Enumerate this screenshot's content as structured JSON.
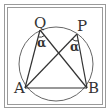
{
  "diagram": {
    "type": "inscribed-angle-geometry",
    "frame": {
      "outer_color": "#9a9a9a",
      "inner_color": "#9a9a9a"
    },
    "circle": {
      "cx": 56,
      "cy": 64,
      "r": 37,
      "stroke": "#666666"
    },
    "points": {
      "Q": {
        "label": "Q",
        "x": 40,
        "y": 30
      },
      "P": {
        "label": "P",
        "x": 77,
        "y": 34
      },
      "A": {
        "label": "A",
        "x": 25,
        "y": 88
      },
      "B": {
        "label": "B",
        "x": 87,
        "y": 88
      }
    },
    "segments": [
      [
        "A",
        "Q"
      ],
      [
        "Q",
        "B"
      ],
      [
        "A",
        "P"
      ],
      [
        "P",
        "B"
      ],
      [
        "A",
        "B"
      ]
    ],
    "angle_marks": [
      {
        "vertex": "Q",
        "label": "α"
      },
      {
        "vertex": "P",
        "label": "α"
      }
    ],
    "line_color": "#333333"
  }
}
